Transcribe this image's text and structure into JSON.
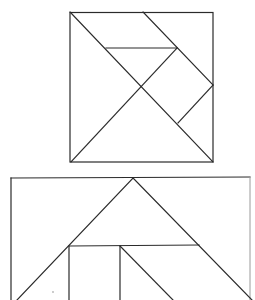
{
  "diagram": {
    "type": "tangram",
    "figures": [
      {
        "name": "square-tangram",
        "outline": {
          "x1": 70,
          "y1": 12,
          "x2": 213,
          "y2": 162
        },
        "lines": [
          {
            "id": "main-diagonal",
            "x1": 70,
            "y1": 12,
            "x2": 213,
            "y2": 162
          },
          {
            "id": "anti-diagonal",
            "x1": 71,
            "y1": 162,
            "x2": 177,
            "y2": 48
          },
          {
            "id": "top-parallel",
            "x1": 143,
            "y1": 12,
            "x2": 213,
            "y2": 85
          },
          {
            "id": "mid-horizontal",
            "x1": 106,
            "y1": 48,
            "x2": 177,
            "y2": 48
          },
          {
            "id": "square-edge",
            "x1": 213,
            "y1": 85,
            "x2": 178,
            "y2": 123
          }
        ]
      },
      {
        "name": "house-tangram",
        "lines": [
          {
            "id": "top-border",
            "x1": 11,
            "y1": 178,
            "x2": 250,
            "y2": 177
          },
          {
            "id": "left-border",
            "x1": 11,
            "y1": 178,
            "x2": 11,
            "y2": 300
          },
          {
            "id": "right-border",
            "x1": 250,
            "y1": 177,
            "x2": 250,
            "y2": 300
          },
          {
            "id": "roof-left",
            "x1": 133,
            "y1": 178,
            "x2": 17,
            "y2": 300
          },
          {
            "id": "roof-right",
            "x1": 133,
            "y1": 178,
            "x2": 252,
            "y2": 300
          },
          {
            "id": "crossbar",
            "x1": 69,
            "y1": 246,
            "x2": 199,
            "y2": 245
          },
          {
            "id": "left-post",
            "x1": 69,
            "y1": 246,
            "x2": 69,
            "y2": 300
          },
          {
            "id": "right-post",
            "x1": 120,
            "y1": 246,
            "x2": 120,
            "y2": 300
          },
          {
            "id": "inner-diagonal",
            "x1": 120,
            "y1": 246,
            "x2": 173,
            "y2": 300
          }
        ]
      }
    ],
    "colors": {
      "stroke": "#2b2b2b",
      "background": "#ffffff"
    }
  }
}
